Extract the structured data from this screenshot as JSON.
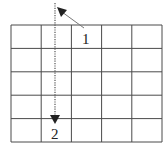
{
  "diagram": {
    "grid": {
      "rows": 5,
      "columns": 5
    },
    "arrows": [
      {
        "id": "1",
        "label": "1",
        "style": "solid",
        "direction": "up-left"
      },
      {
        "id": "2",
        "label": "2",
        "style": "dotted",
        "direction": "down"
      }
    ],
    "colors": {
      "line": "#4a4a4a",
      "arrow": "#222222",
      "background": "#ffffff"
    }
  }
}
